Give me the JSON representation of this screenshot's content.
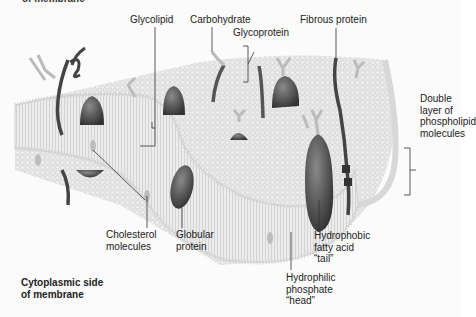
{
  "diagram": {
    "title_cut": "of membrane",
    "labels": {
      "glycolipid": "Glycolipid",
      "carbohydrate": "Carbohydrate",
      "glycoprotein": "Glycoprotein",
      "fibrous_protein": "Fibrous protein",
      "double_layer_1": "Double",
      "double_layer_2": "layer of",
      "double_layer_3": "phospholipid",
      "double_layer_4": "molecules",
      "cholesterol_1": "Cholesterol",
      "cholesterol_2": "molecules",
      "globular_1": "Globular",
      "globular_2": "protein",
      "hydrophobic_1": "Hydrophobic",
      "hydrophobic_2": "fatty acid",
      "hydrophobic_3": "“tail”",
      "hydrophilic_1": "Hydrophilic",
      "hydrophilic_2": "phosphate",
      "hydrophilic_3": "“head”",
      "cytoplasmic_1": "Cytoplasmic side",
      "cytoplasmic_2": "of membrane"
    },
    "colors": {
      "background": "#fbfbfb",
      "membrane_surface": "#e4e4e4",
      "membrane_edge": "#cfcfcf",
      "protein": "#5e5e5e",
      "protein_dark": "#3f3f3f",
      "carbohydrate": "#bdbdbd",
      "leader_line": "#333333",
      "text": "#222222"
    }
  }
}
